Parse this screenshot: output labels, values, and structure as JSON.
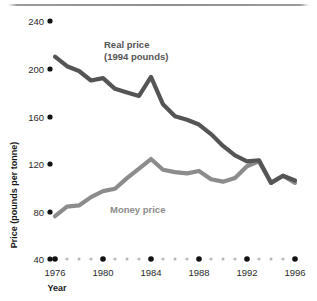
{
  "chart_data": {
    "type": "line",
    "title": "",
    "xlabel": "Year",
    "ylabel": "Price (pounds per tonne)",
    "xlim": [
      1976,
      1996
    ],
    "ylim": [
      40,
      240
    ],
    "yticks": [
      240,
      200,
      160,
      120,
      80,
      40
    ],
    "xticks": [
      1976,
      1980,
      1984,
      1988,
      1992,
      1996
    ],
    "xticklabels": [
      "1976",
      "1980",
      "1984",
      "1988",
      "1992",
      "1996"
    ],
    "yticklabels": [
      "240",
      "200",
      "160",
      "120",
      "80",
      "40"
    ],
    "grid": false,
    "legend": "inline-annotations",
    "x": [
      1976,
      1977,
      1978,
      1979,
      1980,
      1981,
      1982,
      1983,
      1984,
      1985,
      1986,
      1987,
      1988,
      1989,
      1990,
      1991,
      1992,
      1993,
      1994,
      1995,
      1996
    ],
    "series": [
      {
        "name": "Real price (1994 pounds)",
        "color": "#555555",
        "values": [
          210,
          202,
          198,
          190,
          192,
          183,
          180,
          177,
          193,
          170,
          160,
          157,
          153,
          145,
          135,
          127,
          122,
          123,
          104,
          110,
          106
        ]
      },
      {
        "name": "Money price",
        "color": "#8c8c8c",
        "values": [
          76,
          84,
          85,
          92,
          97,
          99,
          108,
          116,
          124,
          115,
          113,
          112,
          114,
          107,
          105,
          108,
          118,
          122,
          104,
          110,
          104
        ]
      }
    ],
    "annotations": [
      {
        "name": "real-price-label",
        "text_line1": "Real price",
        "text_line2": "(1994 pounds)",
        "color": "#555555"
      },
      {
        "name": "money-price-label",
        "text_line1": "Money price",
        "text_line2": "",
        "color": "#8c8c8c"
      }
    ]
  },
  "axes": {
    "x_title": "Year",
    "y_title": "Price (pounds per tonne)"
  },
  "labels": {
    "real_price_line1": "Real price",
    "real_price_line2": "(1994 pounds)",
    "money_price": "Money price"
  },
  "yticks": {
    "t0": "240",
    "t1": "200",
    "t2": "160",
    "t3": "120",
    "t4": "80",
    "t5": "40"
  },
  "xticks": {
    "t0": "1976",
    "t1": "1980",
    "t2": "1984",
    "t3": "1988",
    "t4": "1992",
    "t5": "1996"
  },
  "colors": {
    "real_price": "#555555",
    "money_price": "#8c8c8c",
    "tick_dot": "#111111",
    "minor_dot": "#b5b5b5",
    "text": "#2b2b2b"
  }
}
